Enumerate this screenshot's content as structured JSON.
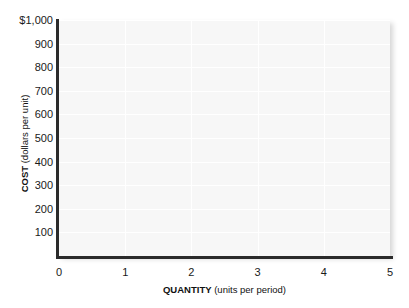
{
  "chart_data": {
    "type": "line",
    "title": "",
    "subtitle": "",
    "note": "Blank graph template: axes and gridlines only, no data series plotted.",
    "series": [],
    "x": [],
    "xlabel_key": "QUANTITY",
    "xlabel_unit": "(units per period)",
    "ylabel_key": "COST",
    "ylabel_unit": "(dollars per unit)",
    "xlim": [
      0,
      5
    ],
    "ylim": [
      0,
      1000
    ],
    "xticks": [
      0,
      1,
      2,
      3,
      4,
      5
    ],
    "xtick_labels": [
      "0",
      "1",
      "2",
      "3",
      "4",
      "5"
    ],
    "yticks": [
      100,
      200,
      300,
      400,
      500,
      600,
      700,
      800,
      900,
      1000
    ],
    "ytick_labels": [
      "100",
      "200",
      "300",
      "400",
      "500",
      "600",
      "700",
      "800",
      "900",
      "$1,000"
    ],
    "grid": true,
    "grid_color": "#ffffff",
    "plot_background": "#f7f7f7",
    "axis_color": "#2b2b2b",
    "legend": [],
    "legend_position": "none",
    "annotations": []
  }
}
